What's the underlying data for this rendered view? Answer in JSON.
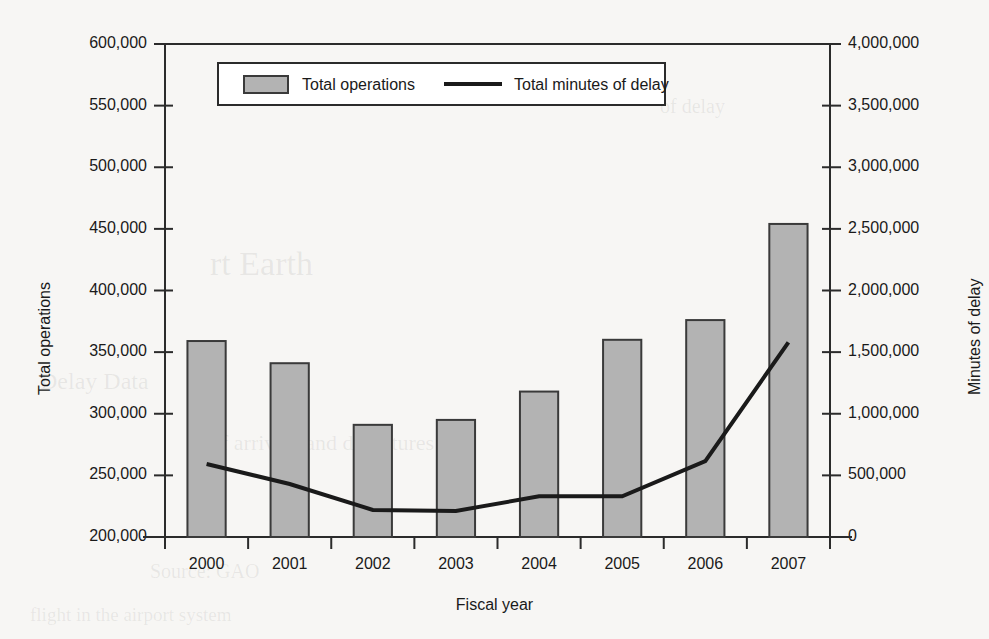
{
  "chart_data": {
    "type": "bar",
    "title": "",
    "xlabel": "Fiscal year",
    "categories": [
      "2000",
      "2001",
      "2002",
      "2003",
      "2004",
      "2005",
      "2006",
      "2007"
    ],
    "grid": false,
    "legend_position": "top-center",
    "series": [
      {
        "name": "Total operations",
        "type": "bar",
        "axis": "left",
        "ylabel": "Total operations",
        "ylim": [
          200000,
          600000
        ],
        "ytick_step": 50000,
        "yticks": [
          200000,
          250000,
          300000,
          350000,
          400000,
          450000,
          500000,
          550000,
          600000
        ],
        "ytick_labels": [
          "200,000",
          "250,000",
          "300,000",
          "350,000",
          "400,000",
          "450,000",
          "500,000",
          "550,000",
          "600,000"
        ],
        "values": [
          359000,
          341000,
          291000,
          295000,
          318000,
          360000,
          376000,
          454000
        ],
        "fill_color": "#b3b3b3",
        "edge_color": "#3a3a3a"
      },
      {
        "name": "Total minutes of delay",
        "type": "line",
        "axis": "right",
        "ylabel": "Minutes of delay",
        "ylim": [
          0,
          4000000
        ],
        "ytick_step": 500000,
        "yticks": [
          0,
          500000,
          1000000,
          1500000,
          2000000,
          2500000,
          3000000,
          3500000,
          4000000
        ],
        "ytick_labels": [
          "0",
          "500,000",
          "1,000,000",
          "1,500,000",
          "2,000,000",
          "2,500,000",
          "3,000,000",
          "3,500,000",
          "4,000,000"
        ],
        "values": [
          592000,
          430000,
          220000,
          212000,
          330000,
          330000,
          615000,
          1580000
        ],
        "line_color": "#1a1a1a",
        "line_width": 4
      }
    ]
  },
  "legend": {
    "items": [
      {
        "label": "Total operations",
        "marker": "swatch"
      },
      {
        "label": "Total minutes of delay",
        "marker": "line"
      }
    ]
  },
  "axes": {
    "left_title": "Total operations",
    "right_title": "Minutes of delay",
    "x_title": "Fiscal year"
  },
  "bleed_text": {
    "l1": "rt Earth",
    "l2": "Delay Data",
    "l3": "of arrivals and departures",
    "l4": "Source: GAO",
    "l5": "flight in the airport system",
    "l6": "of delay"
  }
}
